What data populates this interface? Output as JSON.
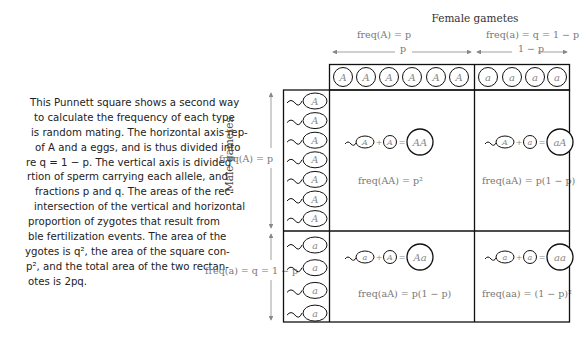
{
  "caption": {
    "lines": [
      "This Punnett square shows a second way",
      "to calculate the frequency of each type",
      "is random mating. The horizontal axis rep-",
      "of A and a eggs, and is thus divided into",
      "re q = 1 − p. The vertical axis is divided",
      "rtion of sperm carrying each allele, and",
      "fractions p and q. The areas of the rec-",
      "intersection of the vertical and horizontal",
      "proportion of zygotes that result from",
      "ble fertilization events. The area of the",
      "ygotes is q², the area of the square con-",
      "p², and the total area of the two rectan-",
      "otes is 2pq."
    ]
  },
  "diagram": {
    "title": "Female gametes",
    "female_A_label": "freq(A) = p",
    "female_a_label": "freq(a) = q = 1 − p",
    "female_A_span": "p",
    "female_a_span": "1 − p",
    "male_axis_title": "Male gametes",
    "male_A_label": "freq(A) = p",
    "male_a_label": "freq(a) = q = 1 − p",
    "female_eggs": [
      "A",
      "A",
      "A",
      "A",
      "A",
      "A",
      "a",
      "a",
      "a",
      "a"
    ],
    "male_sperm": [
      "A",
      "A",
      "A",
      "A",
      "A",
      "A",
      "A",
      "a",
      "a",
      "a",
      "a"
    ],
    "cells": [
      {
        "sperm": "A",
        "egg": "A",
        "zygote": "AA",
        "freq": "freq(AA) = p²"
      },
      {
        "sperm": "A",
        "egg": "a",
        "zygote": "aA",
        "freq": "freq(aA) = p(1 − p)"
      },
      {
        "sperm": "a",
        "egg": "A",
        "zygote": "Aa",
        "freq": "freq(aA) = p(1 − p)"
      },
      {
        "sperm": "a",
        "egg": "a",
        "zygote": "aa",
        "freq": "freq(aa) = (1 − p)²"
      }
    ]
  }
}
